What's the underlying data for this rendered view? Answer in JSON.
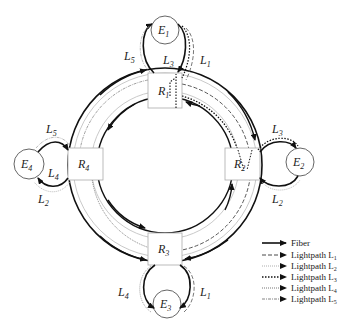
{
  "diagram": {
    "nodes": {
      "routers": [
        {
          "id": "R1",
          "label": "R",
          "sub": "1"
        },
        {
          "id": "R2",
          "label": "R",
          "sub": "2"
        },
        {
          "id": "R3",
          "label": "R",
          "sub": "3"
        },
        {
          "id": "R4",
          "label": "R",
          "sub": "4"
        }
      ],
      "endpoints": [
        {
          "id": "E1",
          "label": "E",
          "sub": "1"
        },
        {
          "id": "E2",
          "label": "E",
          "sub": "2"
        },
        {
          "id": "E3",
          "label": "E",
          "sub": "3"
        },
        {
          "id": "E4",
          "label": "E",
          "sub": "4"
        }
      ]
    },
    "path_labels": {
      "e1_left": {
        "label": "L",
        "sub": "5"
      },
      "e1_mid": {
        "label": "L",
        "sub": "3"
      },
      "e1_right": {
        "label": "L",
        "sub": "1"
      },
      "e2_top": {
        "label": "L",
        "sub": "3"
      },
      "e2_bottom": {
        "label": "L",
        "sub": "2"
      },
      "e3_left": {
        "label": "L",
        "sub": "4"
      },
      "e3_right": {
        "label": "L",
        "sub": "1"
      },
      "e4_top": {
        "label": "L",
        "sub": "5"
      },
      "e4_mid": {
        "label": "L",
        "sub": "4"
      },
      "e4_bottom": {
        "label": "L",
        "sub": "2"
      }
    },
    "legend": [
      {
        "style": "solid",
        "text": "Fiber",
        "sub": ""
      },
      {
        "style": "dashed",
        "text": "Lightpath L",
        "sub": "1"
      },
      {
        "style": "thin-dotted",
        "text": "Lightpath L",
        "sub": "2"
      },
      {
        "style": "dotted",
        "text": "Lightpath L",
        "sub": "3"
      },
      {
        "style": "dense-dotted",
        "text": "Lightpath L",
        "sub": "4"
      },
      {
        "style": "dash-dot",
        "text": "Lightpath L",
        "sub": "5"
      }
    ]
  }
}
